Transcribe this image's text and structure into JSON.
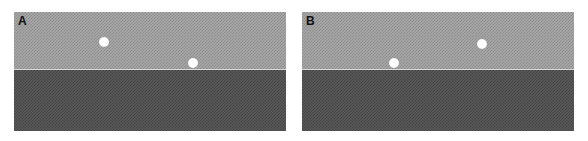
{
  "panels": [
    {
      "label": "A",
      "dots": [
        {
          "x": 90,
          "y": 30
        },
        {
          "x": 179,
          "y": 51
        }
      ]
    },
    {
      "label": "B",
      "dots": [
        {
          "x": 180,
          "y": 32
        },
        {
          "x": 92,
          "y": 51
        }
      ]
    }
  ],
  "colors": {
    "upper_region": "#a0a0a0",
    "lower_region": "#505050",
    "dot": "#ffffff",
    "background": "#ffffff"
  }
}
